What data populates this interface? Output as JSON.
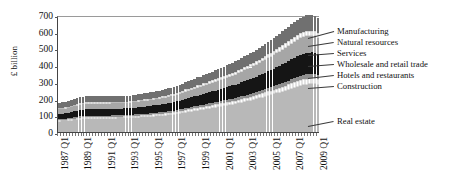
{
  "chart_data": {
    "type": "bar",
    "stacked": true,
    "title": "",
    "xlabel": "",
    "ylabel": "£ billion",
    "ylim": [
      0,
      700
    ],
    "ytick_step": 100,
    "yticks": [
      0,
      100,
      200,
      300,
      400,
      500,
      600,
      700
    ],
    "grid": false,
    "legend_position": "right-leader-lines",
    "x_tick_labels": [
      "1987 Q1",
      "1989 Q1",
      "1991 Q1",
      "1993 Q1",
      "1995 Q1",
      "1997 Q1",
      "1999 Q1",
      "2001 Q1",
      "2003 Q1",
      "2005 Q1",
      "2007 Q1",
      "2009 Q1"
    ],
    "x_tick_every": 8,
    "x_start": "1987 Q1",
    "x_end": "2009 Q1",
    "n_bars": 89,
    "categories": [
      "1987 Q1",
      "1987 Q2",
      "1987 Q3",
      "1987 Q4",
      "1988 Q1",
      "1988 Q2",
      "1988 Q3",
      "1988 Q4",
      "1989 Q1",
      "1989 Q2",
      "1989 Q3",
      "1989 Q4",
      "1990 Q1",
      "1990 Q2",
      "1990 Q3",
      "1990 Q4",
      "1991 Q1",
      "1991 Q2",
      "1991 Q3",
      "1991 Q4",
      "1992 Q1",
      "1992 Q2",
      "1992 Q3",
      "1992 Q4",
      "1993 Q1",
      "1993 Q2",
      "1993 Q3",
      "1993 Q4",
      "1994 Q1",
      "1994 Q2",
      "1994 Q3",
      "1994 Q4",
      "1995 Q1",
      "1995 Q2",
      "1995 Q3",
      "1995 Q4",
      "1996 Q1",
      "1996 Q2",
      "1996 Q3",
      "1996 Q4",
      "1997 Q1",
      "1997 Q2",
      "1997 Q3",
      "1997 Q4",
      "1998 Q1",
      "1998 Q2",
      "1998 Q3",
      "1998 Q4",
      "1999 Q1",
      "1999 Q2",
      "1999 Q3",
      "1999 Q4",
      "2000 Q1",
      "2000 Q2",
      "2000 Q3",
      "2000 Q4",
      "2001 Q1",
      "2001 Q2",
      "2001 Q3",
      "2001 Q4",
      "2002 Q1",
      "2002 Q2",
      "2002 Q3",
      "2002 Q4",
      "2003 Q1",
      "2003 Q2",
      "2003 Q3",
      "2003 Q4",
      "2004 Q1",
      "2004 Q2",
      "2004 Q3",
      "2004 Q4",
      "2005 Q1",
      "2005 Q2",
      "2005 Q3",
      "2005 Q4",
      "2006 Q1",
      "2006 Q2",
      "2006 Q3",
      "2006 Q4",
      "2007 Q1",
      "2007 Q2",
      "2007 Q3",
      "2007 Q4",
      "2008 Q1",
      "2008 Q2",
      "2008 Q3",
      "2008 Q4",
      "2009 Q1"
    ],
    "series": [
      {
        "name": "Real estate",
        "color": "#b8b8b8",
        "values": [
          62,
          63,
          64,
          66,
          68,
          70,
          72,
          74,
          76,
          77,
          78,
          78,
          78,
          78,
          78,
          79,
          79,
          79,
          80,
          80,
          81,
          81,
          82,
          82,
          83,
          84,
          85,
          86,
          87,
          88,
          89,
          90,
          92,
          93,
          95,
          96,
          98,
          100,
          102,
          104,
          107,
          110,
          113,
          116,
          119,
          122,
          125,
          128,
          131,
          134,
          137,
          140,
          143,
          146,
          149,
          152,
          155,
          158,
          161,
          164,
          167,
          171,
          175,
          179,
          183,
          187,
          191,
          196,
          201,
          206,
          211,
          216,
          221,
          226,
          231,
          236,
          242,
          248,
          254,
          260,
          266,
          272,
          277,
          281,
          284,
          286,
          287,
          286,
          283
        ]
      },
      {
        "name": "Hotels and restaurants",
        "color": "#ffffff",
        "values": [
          9,
          9,
          9,
          10,
          10,
          10,
          11,
          11,
          11,
          11,
          11,
          11,
          11,
          11,
          11,
          11,
          11,
          11,
          11,
          11,
          11,
          11,
          11,
          11,
          11,
          11,
          12,
          12,
          12,
          12,
          12,
          12,
          13,
          13,
          13,
          13,
          14,
          14,
          14,
          14,
          15,
          15,
          15,
          16,
          16,
          16,
          17,
          17,
          17,
          18,
          18,
          18,
          19,
          19,
          19,
          20,
          20,
          20,
          21,
          21,
          21,
          22,
          22,
          23,
          23,
          24,
          24,
          25,
          25,
          26,
          26,
          27,
          27,
          28,
          28,
          29,
          30,
          30,
          31,
          32,
          32,
          33,
          34,
          34,
          35,
          35,
          35,
          35,
          34
        ]
      },
      {
        "name": "Construction",
        "color": "#8f8f8f",
        "values": [
          7,
          7,
          7,
          7,
          8,
          8,
          8,
          8,
          8,
          8,
          8,
          8,
          8,
          8,
          8,
          8,
          8,
          8,
          8,
          8,
          8,
          8,
          8,
          8,
          8,
          8,
          8,
          8,
          8,
          9,
          9,
          9,
          9,
          9,
          9,
          9,
          9,
          10,
          10,
          10,
          10,
          10,
          11,
          11,
          11,
          11,
          11,
          12,
          12,
          12,
          12,
          13,
          13,
          13,
          13,
          14,
          14,
          14,
          14,
          15,
          15,
          15,
          16,
          16,
          16,
          17,
          17,
          17,
          18,
          18,
          19,
          19,
          20,
          20,
          21,
          21,
          22,
          22,
          23,
          24,
          24,
          25,
          25,
          26,
          26,
          26,
          26,
          26,
          25
        ]
      },
      {
        "name": "Wholesale and retail trade",
        "color": "#151515",
        "values": [
          30,
          31,
          32,
          33,
          34,
          36,
          37,
          38,
          39,
          40,
          40,
          40,
          40,
          40,
          40,
          40,
          40,
          40,
          40,
          40,
          40,
          40,
          40,
          40,
          40,
          41,
          41,
          42,
          42,
          43,
          43,
          44,
          45,
          45,
          46,
          47,
          48,
          49,
          50,
          51,
          52,
          53,
          54,
          56,
          57,
          58,
          60,
          61,
          62,
          64,
          65,
          67,
          68,
          70,
          71,
          73,
          74,
          76,
          77,
          79,
          80,
          82,
          84,
          86,
          88,
          90,
          92,
          94,
          96,
          98,
          100,
          102,
          104,
          106,
          108,
          110,
          112,
          115,
          117,
          120,
          122,
          124,
          126,
          127,
          128,
          128,
          128,
          127,
          125
        ]
      },
      {
        "name": "Services",
        "color": "#a6a6a6",
        "values": [
          27,
          27,
          28,
          28,
          29,
          30,
          30,
          31,
          31,
          32,
          32,
          32,
          32,
          32,
          32,
          32,
          32,
          32,
          32,
          32,
          32,
          32,
          32,
          32,
          32,
          33,
          33,
          33,
          34,
          34,
          34,
          35,
          35,
          36,
          36,
          37,
          37,
          38,
          39,
          39,
          40,
          41,
          42,
          43,
          44,
          45,
          46,
          47,
          48,
          49,
          50,
          51,
          52,
          53,
          54,
          55,
          56,
          57,
          58,
          59,
          61,
          62,
          63,
          65,
          66,
          68,
          69,
          71,
          72,
          74,
          76,
          77,
          79,
          81,
          83,
          85,
          87,
          89,
          91,
          93,
          95,
          97,
          99,
          100,
          101,
          101,
          101,
          100,
          98
        ]
      },
      {
        "name": "Natural resources",
        "color": "#ffffff",
        "values": [
          8,
          8,
          8,
          8,
          9,
          9,
          9,
          9,
          9,
          9,
          9,
          9,
          9,
          9,
          9,
          9,
          9,
          9,
          9,
          9,
          9,
          9,
          9,
          9,
          9,
          9,
          9,
          10,
          10,
          10,
          10,
          10,
          10,
          10,
          11,
          11,
          11,
          11,
          11,
          12,
          12,
          12,
          12,
          13,
          13,
          13,
          13,
          14,
          14,
          14,
          14,
          15,
          15,
          15,
          16,
          16,
          16,
          17,
          17,
          17,
          18,
          18,
          18,
          19,
          19,
          20,
          20,
          21,
          21,
          22,
          22,
          23,
          23,
          24,
          24,
          25,
          26,
          26,
          27,
          27,
          28,
          29,
          29,
          30,
          30,
          30,
          30,
          30,
          29
        ]
      },
      {
        "name": "Manufacturing",
        "color": "#707070",
        "values": [
          32,
          32,
          33,
          33,
          34,
          35,
          35,
          36,
          36,
          36,
          36,
          36,
          36,
          36,
          36,
          36,
          36,
          36,
          35,
          35,
          35,
          35,
          35,
          35,
          35,
          35,
          35,
          36,
          36,
          36,
          36,
          37,
          37,
          38,
          38,
          39,
          39,
          40,
          40,
          41,
          42,
          42,
          43,
          44,
          45,
          46,
          47,
          48,
          48,
          49,
          50,
          51,
          52,
          53,
          54,
          55,
          56,
          57,
          58,
          59,
          60,
          61,
          63,
          64,
          65,
          66,
          68,
          69,
          70,
          72,
          73,
          75,
          76,
          78,
          79,
          81,
          83,
          84,
          86,
          88,
          89,
          91,
          92,
          93,
          94,
          94,
          94,
          93,
          91
        ]
      }
    ],
    "totals_note": "Bars are totals of the seven stacked series; peak total ≈ 590 in 2008, start ≈ 175 in 1987 Q1",
    "legend_entries": [
      "Manufacturing",
      "Natural resources",
      "Services",
      "Wholesale and retail trade",
      "Hotels and restaurants",
      "Construction",
      "Real estate"
    ]
  }
}
